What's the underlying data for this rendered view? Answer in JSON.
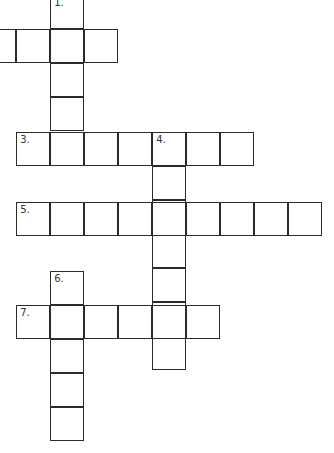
{
  "puzzle": {
    "type": "crossword",
    "cell_size": 34,
    "line_color": "#2b2b2b",
    "entries": [
      {
        "number": "1.",
        "direction": "down",
        "col": 51,
        "row": -4,
        "length": 4
      },
      {
        "number": "2",
        "direction": "across",
        "col": -17,
        "row": 30,
        "length": 4,
        "numbered": false
      },
      {
        "number": "3.",
        "direction": "across",
        "col": 17,
        "row": 133,
        "length": 7
      },
      {
        "number": "4.",
        "direction": "down",
        "col": 153,
        "row": 133,
        "length": 7
      },
      {
        "number": "5.",
        "direction": "across",
        "col": 17,
        "row": 203,
        "length": 9
      },
      {
        "number": "6.",
        "direction": "down",
        "col": 51,
        "row": 272,
        "length": 5
      },
      {
        "number": "7.",
        "direction": "across",
        "col": 17,
        "row": 306,
        "length": 6
      }
    ]
  }
}
